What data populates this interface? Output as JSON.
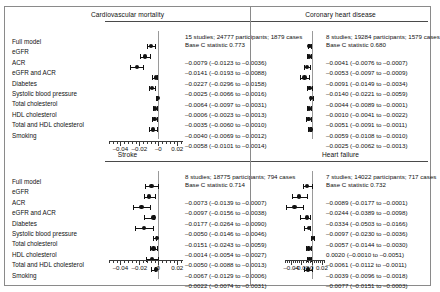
{
  "figure": {
    "row_labels": [
      "Full model",
      "eGFR",
      "ACR",
      "eGFR and ACR",
      "Diabetes",
      "Systolic blood pressure",
      "Total cholesterol",
      "HDL cholesterol",
      "Total and HDL cholesterol",
      "Smoking"
    ],
    "axis": {
      "ticks": [
        -0.04,
        -0.02,
        0,
        0.02
      ],
      "tick_labels": [
        "–0.04",
        "–0.02",
        "–0",
        "0.02"
      ],
      "tick_labels_bottom": [
        "–0.04",
        "–0.02",
        "0",
        "0.02"
      ],
      "min": -0.052,
      "max": 0.026,
      "minor_step": 0.004
    }
  },
  "chart_data": {
    "type": "forest",
    "title": "",
    "xlabel": "Difference in C statistic",
    "ylabel": "",
    "xlim": [
      -0.052,
      0.026
    ],
    "grid": false,
    "legend": "none",
    "categories": [
      "eGFR",
      "ACR",
      "eGFR and ACR",
      "Diabetes",
      "Systolic blood pressure",
      "Total cholesterol",
      "HDL cholesterol",
      "Total and HDL cholesterol",
      "Smoking"
    ],
    "panels": [
      {
        "name": "cardiovascular-mortality",
        "title": "Cardiovascular mortality",
        "studies_line": "15 studies; 24777 participants; 1879 cases",
        "base_c_line": "Base C statistic 0.773",
        "studies": 15,
        "participants": 24777,
        "cases": 1879,
        "base_c_statistic": 0.773,
        "rows": [
          {
            "label": "eGFR",
            "est": -0.0079,
            "lo": -0.0123,
            "hi": -0.0036,
            "text": "–0.0079 (–0.0123 to –0.0036)"
          },
          {
            "label": "ACR",
            "est": -0.0141,
            "lo": -0.0193,
            "hi": -0.0088,
            "text": "–0.0141 (–0.0193 to –0.0088)"
          },
          {
            "label": "eGFR and ACR",
            "est": -0.0227,
            "lo": -0.0296,
            "hi": -0.0158,
            "text": "–0.0227 (–0.0296 to –0.0158)"
          },
          {
            "label": "Diabetes",
            "est": -0.0025,
            "lo": -0.0066,
            "hi": -0.0016,
            "text": "–0.0025 (–0.0066 to –0.0016)"
          },
          {
            "label": "Systolic blood pressure",
            "est": -0.0064,
            "lo": -0.0097,
            "hi": -0.0031,
            "text": "–0.0064 (–0.0097 to –0.0031)"
          },
          {
            "label": "Total cholesterol",
            "est": -0.0006,
            "lo": -0.0023,
            "hi": -0.0013,
            "text": "–0.0006 (–0.0023 to –0.0013)"
          },
          {
            "label": "HDL cholesterol",
            "est": -0.0035,
            "lo": -0.006,
            "hi": -0.001,
            "text": "–0.0035 (–0.0060 to –0.0010)"
          },
          {
            "label": "Total and HDL cholesterol",
            "est": -0.004,
            "lo": -0.0069,
            "hi": -0.0012,
            "text": "–0.0040 (–0.0069 to –0.0012)"
          },
          {
            "label": "Smoking",
            "est": -0.0058,
            "lo": -0.0101,
            "hi": -0.0014,
            "text": "–0.0058 (–0.0101 to –0.0014)"
          }
        ]
      },
      {
        "name": "coronary-heart-disease",
        "title": "Coronary heart disease",
        "studies_line": "8 studies; 19284 participants; 1579 cases",
        "base_c_line": "Base C statistic 0.680",
        "studies": 8,
        "participants": 19284,
        "cases": 1579,
        "base_c_statistic": 0.68,
        "rows": [
          {
            "label": "eGFR",
            "est": -0.0041,
            "lo": -0.0076,
            "hi": -0.0007,
            "text": "–0.0041 (–0.0076 to –0.0007)"
          },
          {
            "label": "ACR",
            "est": -0.0053,
            "lo": -0.0097,
            "hi": -0.0009,
            "text": "–0.0053 (–0.0097 to –0.0009)"
          },
          {
            "label": "eGFR and ACR",
            "est": -0.0091,
            "lo": -0.0149,
            "hi": -0.0034,
            "text": "–0.0091 (–0.0149 to –0.0034)"
          },
          {
            "label": "Diabetes",
            "est": -0.014,
            "lo": -0.0221,
            "hi": -0.0059,
            "text": "–0.0140 (–0.0221 to –0.0059)"
          },
          {
            "label": "Systolic blood pressure",
            "est": -0.0044,
            "lo": -0.0089,
            "hi": -0.0001,
            "text": "–0.0044 (–0.0089 to –0.0001)"
          },
          {
            "label": "Total cholesterol",
            "est": -0.001,
            "lo": -0.0041,
            "hi": 0.0022,
            "text": "–0.0010 (–0.0041 to –0.0022)"
          },
          {
            "label": "HDL cholesterol",
            "est": -0.0051,
            "lo": -0.0091,
            "hi": -0.0011,
            "text": "–0.0051 (–0.0091 to –0.0011)"
          },
          {
            "label": "Total and HDL cholesterol",
            "est": -0.0059,
            "lo": -0.0108,
            "hi": -0.001,
            "text": "–0.0059 (–0.0108 to –0.0010)"
          },
          {
            "label": "Smoking",
            "est": -0.0025,
            "lo": -0.0062,
            "hi": -0.0013,
            "text": "–0.0025 (–0.0062 to –0.0013)"
          }
        ]
      },
      {
        "name": "stroke",
        "title": "Stroke",
        "studies_line": "8 studies; 18775 participants; 794 cases",
        "base_c_line": "Base C statistic 0.714",
        "studies": 8,
        "participants": 18775,
        "cases": 794,
        "base_c_statistic": 0.714,
        "rows": [
          {
            "label": "eGFR",
            "est": -0.0073,
            "lo": -0.0139,
            "hi": -0.0007,
            "text": "–0.0073 (–0.0139 to –0.0007)"
          },
          {
            "label": "ACR",
            "est": -0.0097,
            "lo": -0.0156,
            "hi": -0.0038,
            "text": "–0.0097 (–0.0156 to –0.0038)"
          },
          {
            "label": "eGFR and ACR",
            "est": -0.0177,
            "lo": -0.0264,
            "hi": -0.009,
            "text": "–0.0177 (–0.0264 to –0.0090)"
          },
          {
            "label": "Diabetes",
            "est": -0.005,
            "lo": -0.0146,
            "hi": -0.0046,
            "text": "–0.0050 (–0.0146 to –0.0046)"
          },
          {
            "label": "Systolic blood pressure",
            "est": -0.0151,
            "lo": -0.0243,
            "hi": -0.0059,
            "text": "–0.0151 (–0.0243 to –0.0059)"
          },
          {
            "label": "Total cholesterol",
            "est": -0.0014,
            "lo": -0.0054,
            "hi": -0.0027,
            "text": "–0.0014 (–0.0054 to –0.0027)"
          },
          {
            "label": "HDL cholesterol",
            "est": -0.005,
            "lo": -0.0088,
            "hi": -0.0013,
            "text": "–0.0050 (–0.0088 to –0.0013)"
          },
          {
            "label": "Total and HDL cholesterol",
            "est": -0.0067,
            "lo": -0.0129,
            "hi": -0.0006,
            "text": "–0.0067 (–0.0129 to –0.0006)"
          },
          {
            "label": "Smoking",
            "est": -0.0022,
            "lo": -0.0074,
            "hi": -0.0031,
            "text": "–0.0022 (–0.0074 to –0.0031)"
          }
        ]
      },
      {
        "name": "heart-failure",
        "title": "Heart failure",
        "studies_line": "7 studies; 14022 participants; 717 cases",
        "base_c_line": "Base C statistic 0.732",
        "studies": 7,
        "participants": 14022,
        "cases": 717,
        "base_c_statistic": 0.732,
        "rows": [
          {
            "label": "eGFR",
            "est": -0.0089,
            "lo": -0.0177,
            "hi": -0.0001,
            "text": "–0.0089 (–0.0177 to –0.0001)"
          },
          {
            "label": "ACR",
            "est": -0.0244,
            "lo": -0.0389,
            "hi": -0.0098,
            "text": "–0.0244 (–0.0389 to –0.0098)"
          },
          {
            "label": "eGFR and ACR",
            "est": -0.0334,
            "lo": -0.0503,
            "hi": -0.0166,
            "text": "–0.0334 (–0.0503 to –0.0166)"
          },
          {
            "label": "Diabetes",
            "est": -0.0097,
            "lo": -0.023,
            "hi": -0.0036,
            "text": "–0.0097 (–0.0230 to –0.0036)"
          },
          {
            "label": "Systolic blood pressure",
            "est": -0.0057,
            "lo": -0.0144,
            "hi": -0.003,
            "text": "–0.0057 (–0.0144 to –0.0030)"
          },
          {
            "label": "Total cholesterol",
            "est": 0.002,
            "lo": -0.001,
            "hi": 0.0051,
            "text": "0.0020 (–0.0010 to –0.0051)"
          },
          {
            "label": "HDL cholesterol",
            "est": -0.0061,
            "lo": -0.0112,
            "hi": -0.0011,
            "text": "–0.0061 (–0.0112 to –0.0011)"
          },
          {
            "label": "Total and HDL cholesterol",
            "est": -0.0039,
            "lo": -0.0096,
            "hi": -0.0018,
            "text": "–0.0039 (–0.0096 to –0.0018)"
          },
          {
            "label": "Smoking",
            "est": -0.0077,
            "lo": -0.0151,
            "hi": -0.0003,
            "text": "–0.0077 (–0.0151 to –0.0003)"
          }
        ]
      }
    ]
  }
}
